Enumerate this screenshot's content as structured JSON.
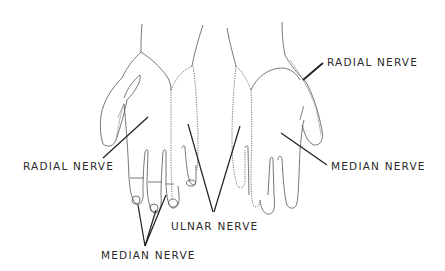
{
  "diagram": {
    "colors": {
      "background": "#ffffff",
      "line": "#555555",
      "text": "#2a2a2a"
    },
    "labels": {
      "radial_left": "RADIAL NERVE",
      "radial_right": "RADIAL NERVE",
      "median_right": "MEDIAN NERVE",
      "median_bottom": "MEDIAN NERVE",
      "ulnar_bottom": "ULNAR NERVE"
    },
    "views": [
      {
        "name": "left-hand-dorsal",
        "regions": [
          "radial",
          "median",
          "ulnar"
        ]
      },
      {
        "name": "right-hand-palmar",
        "regions": [
          "radial",
          "median",
          "ulnar"
        ]
      }
    ]
  }
}
